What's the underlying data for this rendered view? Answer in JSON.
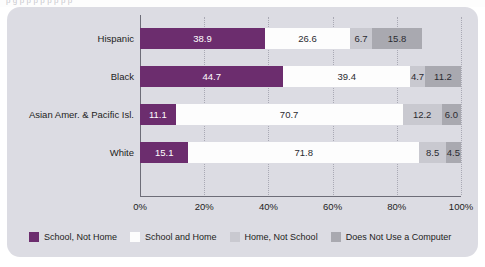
{
  "page": {
    "top_cropped_text": "p g                p     p        p p            p   p   p            p"
  },
  "chart_data": {
    "type": "bar",
    "orientation": "horizontal",
    "stacked": true,
    "normalized_percent": true,
    "title": "",
    "subtitle": "",
    "xlabel": "",
    "ylabel": "",
    "xlim": [
      0,
      100
    ],
    "grid": true,
    "grid_style": "dotted-vertical",
    "legend_position": "bottom",
    "categories": [
      "Hispanic",
      "Black",
      "Asian Amer. & Pacific Isl.",
      "White"
    ],
    "tick_labels": [
      "0%",
      "20%",
      "40%",
      "60%",
      "80%",
      "100%"
    ],
    "tick_values": [
      0,
      20,
      40,
      60,
      80,
      100
    ],
    "series": [
      {
        "name": "School, Not Home",
        "color": "#6c2d6e",
        "values": [
          38.9,
          44.7,
          11.1,
          15.1
        ]
      },
      {
        "name": "School and Home",
        "color": "#fdfdfd",
        "values": [
          26.6,
          39.4,
          70.7,
          71.8
        ]
      },
      {
        "name": "Home, Not School",
        "color": "#c9c9d0",
        "values": [
          6.7,
          4.7,
          12.2,
          8.5
        ]
      },
      {
        "name": "Does Not Use a Computer",
        "color": "#a9a9b0",
        "values": [
          15.8,
          11.2,
          6.0,
          4.5
        ]
      }
    ],
    "bars": [
      {
        "category": "Hispanic",
        "segments": [
          {
            "label": "38.9",
            "value": 38.9
          },
          {
            "label": "26.6",
            "value": 26.6
          },
          {
            "label": "6.7",
            "value": 6.7
          },
          {
            "label": "15.8",
            "value": 15.8
          }
        ]
      },
      {
        "category": "Black",
        "segments": [
          {
            "label": "44.7",
            "value": 44.7
          },
          {
            "label": "39.4",
            "value": 39.4
          },
          {
            "label": "4.7",
            "value": 4.7
          },
          {
            "label": "11.2",
            "value": 11.2
          }
        ]
      },
      {
        "category": "Asian Amer. & Pacific Isl.",
        "segments": [
          {
            "label": "11.1",
            "value": 11.1
          },
          {
            "label": "70.7",
            "value": 70.7
          },
          {
            "label": "12.2",
            "value": 12.2
          },
          {
            "label": "6.0",
            "value": 6.0
          }
        ]
      },
      {
        "category": "White",
        "segments": [
          {
            "label": "15.1",
            "value": 15.1
          },
          {
            "label": "71.8",
            "value": 71.8
          },
          {
            "label": "8.5",
            "value": 8.5
          },
          {
            "label": "4.5",
            "value": 4.5
          }
        ]
      }
    ]
  },
  "legend": {
    "items": [
      {
        "label": "School, Not Home",
        "color": "#6c2d6e"
      },
      {
        "label": "School and Home",
        "color": "#fdfdfd"
      },
      {
        "label": "Home, Not School",
        "color": "#c9c9d0"
      },
      {
        "label": "Does Not Use a Computer",
        "color": "#a9a9b0"
      }
    ]
  },
  "colors": {
    "panel_background": "#dcdce3",
    "axis": "#6d6d78",
    "gridline": "#a9a9b4",
    "text": "#1d1d22"
  }
}
